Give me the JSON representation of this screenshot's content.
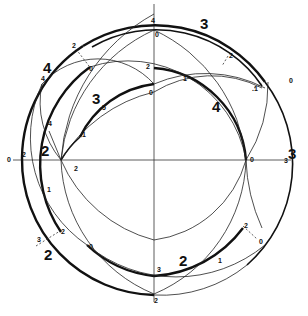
{
  "diagram": {
    "type": "geometric-construction",
    "big_labels": [
      {
        "id": "big-3-top",
        "text": "3",
        "x": 200,
        "y": 29
      },
      {
        "id": "big-4-left",
        "text": "4",
        "x": 43,
        "y": 73
      },
      {
        "id": "big-3-mid",
        "text": "3",
        "x": 92,
        "y": 104
      },
      {
        "id": "big-4-right",
        "text": "4",
        "x": 212,
        "y": 112
      },
      {
        "id": "big-2-left",
        "text": "2",
        "x": 41,
        "y": 156
      },
      {
        "id": "big-3-right",
        "text": "3",
        "x": 288,
        "y": 159
      },
      {
        "id": "big-2-lower-left",
        "text": "2",
        "x": 44,
        "y": 260
      },
      {
        "id": "big-2-bottom",
        "text": "2",
        "x": 179,
        "y": 266
      }
    ],
    "small_labels": [
      {
        "text": "4",
        "x": 151,
        "y": 23
      },
      {
        "text": "0",
        "x": 155,
        "y": 37
      },
      {
        "text": "2",
        "x": 72,
        "y": 48
      },
      {
        "text": "0",
        "x": 89,
        "y": 71
      },
      {
        "text": "2",
        "x": 229,
        "y": 58
      },
      {
        "text": "4",
        "x": 41,
        "y": 81
      },
      {
        "text": "2",
        "x": 146,
        "y": 69
      },
      {
        "text": "1",
        "x": 183,
        "y": 81
      },
      {
        "text": "0",
        "x": 149,
        "y": 95
      },
      {
        "text": "0",
        "x": 289,
        "y": 83
      },
      {
        "text": ".1",
        "x": 252,
        "y": 91
      },
      {
        "text": "5",
        "x": 102,
        "y": 110
      },
      {
        "text": "4",
        "x": 48,
        "y": 126
      },
      {
        "text": "1",
        "x": 82,
        "y": 137
      },
      {
        "text": "2",
        "x": 22,
        "y": 157
      },
      {
        "text": "0",
        "x": 7,
        "y": 162
      },
      {
        "text": "2",
        "x": 74,
        "y": 171
      },
      {
        "text": "0",
        "x": 250,
        "y": 162
      },
      {
        "text": "3",
        "x": 284,
        "y": 163
      },
      {
        "text": "1",
        "x": 47,
        "y": 192
      },
      {
        "text": "2",
        "x": 61,
        "y": 234
      },
      {
        "text": "3",
        "x": 37,
        "y": 242
      },
      {
        "text": "0",
        "x": 89,
        "y": 249
      },
      {
        "text": "2",
        "x": 244,
        "y": 228
      },
      {
        "text": "0",
        "x": 259,
        "y": 244
      },
      {
        "text": "1",
        "x": 218,
        "y": 263
      },
      {
        "text": "3",
        "x": 157,
        "y": 272
      },
      {
        "text": "2",
        "x": 154,
        "y": 303
      }
    ]
  }
}
